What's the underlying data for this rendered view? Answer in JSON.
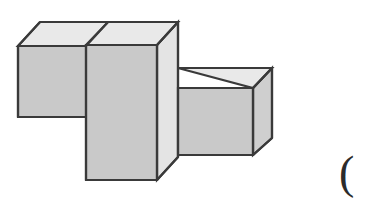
{
  "figure": {
    "type": "3d-isometric-line-drawing",
    "background_color": "#ffffff",
    "stroke_color": "#3a3a3a",
    "stroke_width": 2.2,
    "colors": {
      "top_face": "#e9e9e9",
      "front_face": "#c9c9c9",
      "side_face": "#cfcfcf",
      "outline": "#3a3a3a"
    },
    "parts": [
      {
        "name": "left-low-block",
        "description": "low block at far left, one unit tall",
        "top_face_points": "18,46 40,22 110,22 88,46",
        "front_face_points": "18,46 88,46 88,117 18,117"
      },
      {
        "name": "center-tall-block",
        "description": "tall block in the middle, extends below the others",
        "top_face_points": "86,45 108,22 178,22 157,45",
        "front_face_points": "86,45 157,45 157,180 86,180",
        "side_face_points": "157,45 178,22 178,157 157,180"
      },
      {
        "name": "right-small-cube",
        "description": "small cube at right, one unit on each side",
        "top_face_points": "178,68 196,68 272,68 253,88",
        "front_face_points": "178,88 253,88 253,155 178,155",
        "side_face_points": "253,88 272,68 272,138 253,155"
      }
    ],
    "annotation": {
      "paren_glyph": "("
    }
  }
}
